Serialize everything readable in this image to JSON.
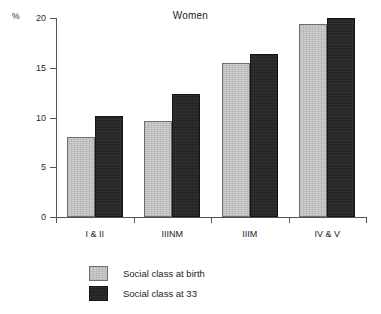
{
  "chart_data": {
    "type": "bar",
    "title": "Women",
    "xlabel": "",
    "ylabel": "%",
    "ylim": [
      0,
      20
    ],
    "yticks": [
      0,
      5,
      10,
      15,
      20
    ],
    "ytick_labels": [
      "0",
      "5",
      "10",
      "15",
      "20"
    ],
    "grid": false,
    "legend_position": "bottom-center",
    "categories": [
      "I & II",
      "IIINM",
      "IIIM",
      "IV & V"
    ],
    "series": [
      {
        "name": "Social class at birth",
        "color": "#c8c8c8",
        "values": [
          8.0,
          9.7,
          15.5,
          19.4
        ]
      },
      {
        "name": "Social class at 33",
        "color": "#262626",
        "values": [
          10.2,
          12.4,
          16.4,
          20.0
        ]
      }
    ]
  },
  "axis": {
    "unit_label": "%"
  },
  "legend": {
    "entries": [
      {
        "label": "Social class at birth",
        "swatch": "light-gray-swatch"
      },
      {
        "label": "Social class at 33",
        "swatch": "dark-swatch"
      }
    ]
  }
}
